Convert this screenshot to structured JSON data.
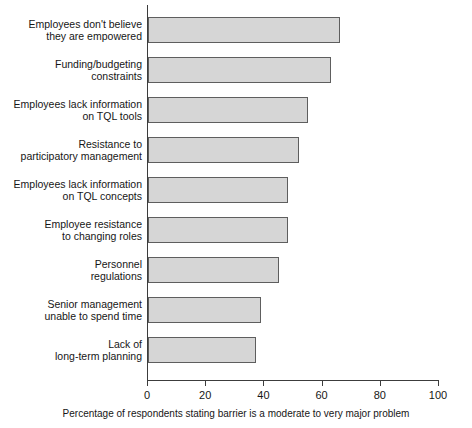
{
  "chart_data": {
    "type": "bar",
    "orientation": "horizontal",
    "title": "",
    "xlabel": "Percentage of respondents stating barrier is a moderate to very major problem",
    "ylabel": "",
    "xlim": [
      0,
      100
    ],
    "xticks": [
      0,
      20,
      40,
      60,
      80,
      100
    ],
    "xtick_labels": [
      "0",
      "20",
      "40",
      "60",
      "80",
      "100"
    ],
    "grid": false,
    "legend": null,
    "bar_fill_color": "#d6d6d6",
    "bar_border_color": "#5e5e5e",
    "axis_color": "#3c3c3c",
    "categories": [
      "Employees don't believe they are empowered",
      "Funding/budgeting constraints",
      "Employees lack information on TQL tools",
      "Resistance to participatory management",
      "Employees lack information on TQL concepts",
      "Employee resistance to changing roles",
      "Personnel regulations",
      "Senior management unable to spend time",
      "Lack of long-term planning"
    ],
    "category_lines": [
      [
        "Employees don't believe",
        "they are empowered"
      ],
      [
        "Funding/budgeting",
        "constraints"
      ],
      [
        "Employees lack information",
        "on TQL tools"
      ],
      [
        "Resistance to",
        "participatory management"
      ],
      [
        "Employees lack information",
        "on TQL concepts"
      ],
      [
        "Employee resistance",
        "to changing roles"
      ],
      [
        "Personnel",
        "regulations"
      ],
      [
        "Senior management",
        "unable to spend time"
      ],
      [
        "Lack of",
        "long-term planning"
      ]
    ],
    "values": [
      66,
      63,
      55,
      52,
      48,
      48,
      45,
      39,
      37
    ]
  }
}
